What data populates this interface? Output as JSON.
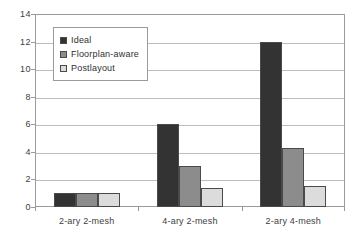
{
  "chart_data": {
    "type": "bar",
    "title": "",
    "xlabel": "",
    "ylabel": "",
    "categories": [
      "2-ary 2-mesh",
      "4-ary 2-mesh",
      "2-ary 4-mesh"
    ],
    "series": [
      {
        "name": "Ideal",
        "color": "#333333",
        "values": [
          1.0,
          6.0,
          12.0
        ]
      },
      {
        "name": "Floorplan-aware",
        "color": "#8c8c8c",
        "values": [
          1.0,
          3.0,
          4.3
        ]
      },
      {
        "name": "Postlayout",
        "color": "#dcdcdc",
        "values": [
          1.0,
          1.4,
          1.5
        ]
      }
    ],
    "ylim": [
      0,
      14
    ],
    "y_ticks": [
      "0",
      "2",
      "4",
      "6",
      "8",
      "10",
      "12",
      "14"
    ],
    "y_tick_values": [
      0,
      2,
      4,
      6,
      8,
      10,
      12,
      14
    ],
    "grid": true,
    "legend_position": "upper-left-inside"
  },
  "legend": {
    "entries": [
      {
        "label": "Ideal"
      },
      {
        "label": "Floorplan-aware"
      },
      {
        "label": "Postlayout"
      }
    ]
  },
  "axis": {
    "y_labels": [
      "14",
      "12",
      "10",
      "8",
      "6",
      "4",
      "2",
      "0"
    ],
    "x_labels": [
      "2-ary 2-mesh",
      "4-ary 2-mesh",
      "2-ary 4-mesh"
    ]
  },
  "colors": {
    "series_ideal": "#333333",
    "series_floorplan": "#8c8c8c",
    "series_postlayout": "#dcdcdc",
    "grid": "#bcbcbc",
    "frame": "#9a9a9a",
    "text": "#404040",
    "background": "#ffffff"
  }
}
